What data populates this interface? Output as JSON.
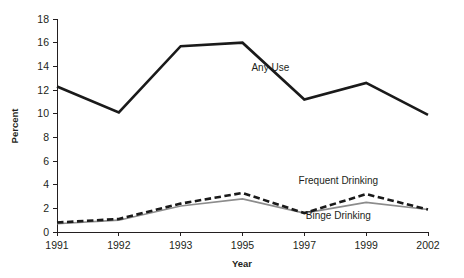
{
  "chart_data": {
    "type": "line",
    "title": "",
    "xlabel": "Year",
    "ylabel": "Percent",
    "categories": [
      "1991",
      "1992",
      "1993",
      "1995",
      "1997",
      "1999",
      "2002"
    ],
    "ylim": [
      0,
      18
    ],
    "yticks": [
      0,
      2,
      4,
      6,
      8,
      10,
      12,
      14,
      16,
      18
    ],
    "ytick_labels": [
      "0",
      "2",
      "4",
      "6",
      "8",
      "10",
      "12",
      "14",
      "16",
      "18"
    ],
    "grid": false,
    "legend_position": "inline-annotations",
    "series": [
      {
        "name": "Any Use",
        "values": [
          12.3,
          10.1,
          15.7,
          16.0,
          11.2,
          12.6,
          9.9
        ],
        "style": "solid",
        "color": "#1a1a1a",
        "width": 2.6,
        "label_x": 1995.9,
        "label_y": 13.6
      },
      {
        "name": "Frequent Drinking",
        "values": [
          0.8,
          1.1,
          2.4,
          3.3,
          1.6,
          3.2,
          1.9
        ],
        "style": "dashed",
        "color": "#1a1a1a",
        "width": 2.6,
        "label_x": 1998.1,
        "label_y": 4.05
      },
      {
        "name": "Binge Drinking",
        "values": [
          0.7,
          1.0,
          2.2,
          2.8,
          1.6,
          2.5,
          1.9
        ],
        "style": "solid",
        "color": "#8c8c8c",
        "width": 1.6,
        "label_x": 1998.1,
        "label_y": 1.1
      }
    ]
  },
  "axes": {
    "y_title": "Percent",
    "x_title": "Year",
    "y_ticks": [
      "18",
      "16",
      "14",
      "12",
      "10",
      "8",
      "6",
      "4",
      "2",
      "0"
    ],
    "x_ticks": [
      "1991",
      "1992",
      "1993",
      "1995",
      "1997",
      "1999",
      "2002"
    ]
  },
  "annotations": {
    "any_use": "Any Use",
    "frequent_drinking": "Frequent Drinking",
    "binge_drinking": "Binge Drinking"
  },
  "colors": {
    "line_dark": "#1a1a1a",
    "line_gray": "#8c8c8c",
    "axis": "#231f20",
    "background": "#ffffff"
  }
}
